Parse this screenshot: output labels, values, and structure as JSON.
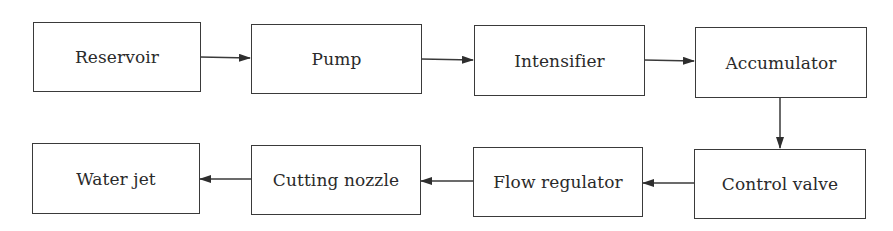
{
  "diagram": {
    "type": "flowchart",
    "nodes": [
      {
        "id": "reservoir",
        "label": "Reservoir"
      },
      {
        "id": "pump",
        "label": "Pump"
      },
      {
        "id": "intensifier",
        "label": "Intensifier"
      },
      {
        "id": "accumulator",
        "label": "Accumulator"
      },
      {
        "id": "control_valve",
        "label": "Control valve"
      },
      {
        "id": "flow_regulator",
        "label": "Flow regulator"
      },
      {
        "id": "cutting_nozzle",
        "label": "Cutting nozzle"
      },
      {
        "id": "water_jet",
        "label": "Water jet"
      }
    ],
    "edges": [
      {
        "from": "reservoir",
        "to": "pump"
      },
      {
        "from": "pump",
        "to": "intensifier"
      },
      {
        "from": "intensifier",
        "to": "accumulator"
      },
      {
        "from": "accumulator",
        "to": "control_valve"
      },
      {
        "from": "control_valve",
        "to": "flow_regulator"
      },
      {
        "from": "flow_regulator",
        "to": "cutting_nozzle"
      },
      {
        "from": "cutting_nozzle",
        "to": "water_jet"
      }
    ]
  },
  "colors": {
    "stroke": "#3a3a3a",
    "text": "#2a2a2a",
    "background": "#ffffff"
  }
}
